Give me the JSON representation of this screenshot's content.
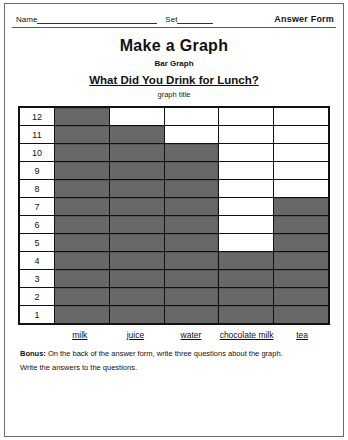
{
  "header": {
    "name_label": "Name",
    "set_label": "Set",
    "answer_form": "Answer Form"
  },
  "title": "Make a Graph",
  "subtitle": "Bar Graph",
  "question": "What Did You Drink for Lunch?",
  "graph_title_caption": "graph title",
  "bonus": {
    "label": "Bonus:",
    "line1": " On the back of the answer form, write three questions about the graph.",
    "line2": "Write the answers to the questions."
  },
  "chart_data": {
    "type": "bar",
    "title": "What Did You Drink for Lunch?",
    "xlabel": "",
    "ylabel": "",
    "categories": [
      "milk",
      "juice",
      "water",
      "chocolate milk",
      "tea"
    ],
    "values": [
      12,
      11,
      10,
      4,
      7
    ],
    "ylim": [
      0,
      12
    ],
    "y_ticks": [
      12,
      11,
      10,
      9,
      8,
      7,
      6,
      5,
      4,
      3,
      2,
      1
    ],
    "grid": true,
    "legend": "none"
  }
}
